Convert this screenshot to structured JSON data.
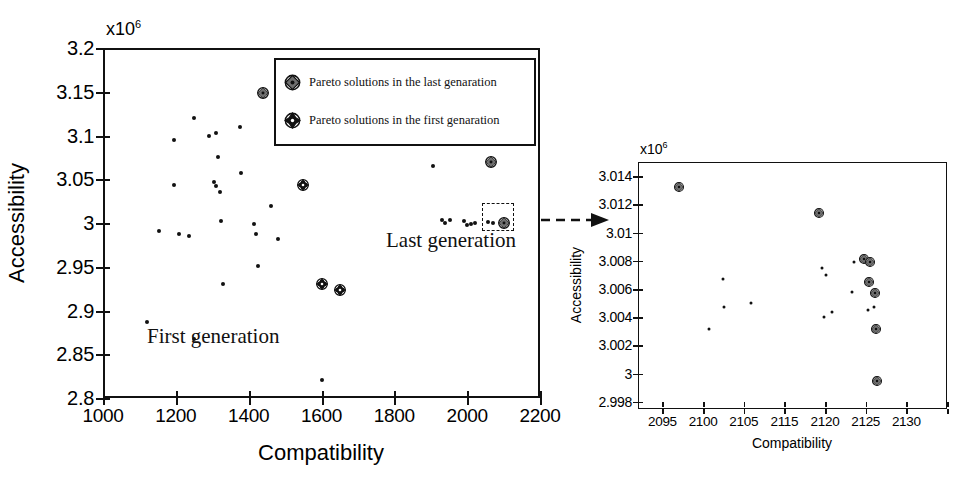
{
  "figure": {
    "background": "#ffffff",
    "ink_color": "#111111"
  },
  "main": {
    "exponent_label": "x10",
    "exponent_sup": "6",
    "x_title": "Compatibility",
    "y_title": "Accessibility",
    "x_ticks": [
      "1000",
      "1200",
      "1400",
      "1600",
      "1800",
      "2000",
      "2200"
    ],
    "y_ticks": [
      "3.2",
      "3.15",
      "3.1",
      "3.05",
      "3",
      "2.95",
      "2.9",
      "2.85",
      "2.8"
    ],
    "annotation_first": "First generation",
    "annotation_last": "Last generation",
    "legend": {
      "items": [
        {
          "marker": "pareto-last-marker",
          "label": "Pareto solutions in the last genaration"
        },
        {
          "marker": "pareto-first-marker",
          "label": "Pareto solutions in the first genaration"
        }
      ]
    }
  },
  "inset": {
    "exponent_label": "x10",
    "exponent_sup": "6",
    "x_title": "Compatibility",
    "y_title": "Accessibility",
    "x_ticks": [
      "2095",
      "2100",
      "2105",
      "2115",
      "2120",
      "2125",
      "2130"
    ],
    "y_ticks": [
      "3.014",
      "3.012",
      "3.01",
      "3.008",
      "3.006",
      "3.004",
      "3.002",
      "3",
      "2.998"
    ]
  },
  "chart_data": [
    {
      "id": "main-scatter",
      "type": "scatter",
      "title": "",
      "xlabel": "Compatibility",
      "ylabel": "Accessibility",
      "xlim": [
        1000,
        2200
      ],
      "ylim": [
        2800000,
        3200000
      ],
      "y_scale_multiplier": 1000000,
      "xticks": [
        1000,
        1200,
        1400,
        1600,
        1800,
        2000,
        2200
      ],
      "yticks": [
        2800000,
        2850000,
        2900000,
        2950000,
        3000000,
        3050000,
        3100000,
        3150000,
        3200000
      ],
      "grid": false,
      "legend_position": "top-right",
      "annotations": [
        {
          "text": "First generation",
          "x": 1180,
          "y": 2920000
        },
        {
          "text": "Last generation",
          "x": 1940,
          "y": 2975000
        }
      ],
      "series": [
        {
          "name": "First generation solutions",
          "marker": "small-dot",
          "points": [
            [
              1120,
              2887000
            ],
            [
              1155,
              2991000
            ],
            [
              1195,
              3095000
            ],
            [
              1195,
              3043000
            ],
            [
              1210,
              2988000
            ],
            [
              1235,
              2985000
            ],
            [
              1250,
              3120000
            ],
            [
              1250,
              2868000
            ],
            [
              1290,
              3100000
            ],
            [
              1305,
              3047000
            ],
            [
              1310,
              3103000
            ],
            [
              1310,
              3042000
            ],
            [
              1315,
              3075000
            ],
            [
              1320,
              3035000
            ],
            [
              1325,
              3002000
            ],
            [
              1330,
              2930000
            ],
            [
              1375,
              3110000
            ],
            [
              1380,
              3057000
            ],
            [
              1415,
              2999000
            ],
            [
              1420,
              2988000
            ],
            [
              1425,
              2951000
            ],
            [
              1460,
              3020000
            ],
            [
              1480,
              2982000
            ],
            [
              1600,
              2821000
            ],
            [
              1905,
              3065000
            ],
            [
              1930,
              3004000
            ],
            [
              1940,
              3000000
            ],
            [
              1952,
              3003000
            ],
            [
              1990,
              3002000
            ],
            [
              2000,
              2998000
            ],
            [
              2010,
              2999000
            ],
            [
              2022,
              3000000
            ],
            [
              2058,
              3001000
            ],
            [
              2072,
              3000000
            ]
          ]
        },
        {
          "name": "Pareto solutions in the last genaration",
          "marker": "pareto-last-marker",
          "points": [
            [
              1440,
              3149000
            ],
            [
              2065,
              3070000
            ],
            [
              2100,
              3000500
            ]
          ]
        },
        {
          "name": "Pareto solutions in the first genaration",
          "marker": "pareto-first-marker",
          "points": [
            [
              1550,
              3043000
            ],
            [
              1600,
              2930000
            ],
            [
              1650,
              2923000
            ]
          ]
        }
      ],
      "selection_box": {
        "x_range": [
          2080,
          2120
        ],
        "y_range": [
          2996000,
          3008000
        ]
      },
      "callout_arrow": {
        "from": "selection-box",
        "to": "inset-scatter",
        "style": "dashed"
      }
    },
    {
      "id": "inset-scatter",
      "type": "scatter",
      "title": "",
      "xlabel": "Compatibility",
      "ylabel": "Accessibility",
      "xlim": [
        2092,
        2130
      ],
      "ylim": [
        2997500,
        3015000
      ],
      "y_scale_multiplier": 1000000,
      "xticks": [
        2095,
        2100,
        2105,
        2110,
        2115,
        2120,
        2125,
        2130
      ],
      "xtick_labels": [
        "2095",
        "2100",
        "2105",
        "2115",
        "2120",
        "2125",
        "2130"
      ],
      "yticks": [
        2998000,
        3000000,
        3002000,
        3004000,
        3006000,
        3008000,
        3010000,
        3012000,
        3014000
      ],
      "grid": false,
      "legend_position": "none",
      "series": [
        {
          "name": "Non-Pareto solutions",
          "marker": "small-dot",
          "points": [
            [
              2100.7,
              3003200
            ],
            [
              2102.5,
              3006700
            ],
            [
              2102.6,
              3004700
            ],
            [
              2105.9,
              3005000
            ],
            [
              2114.6,
              3007500
            ],
            [
              2115.1,
              3007000
            ],
            [
              2114.9,
              3004000
            ],
            [
              2115.9,
              3004400
            ],
            [
              2118.3,
              3005800
            ],
            [
              2118.6,
              3007900
            ],
            [
              2120.3,
              3004500
            ],
            [
              2121.0,
              3004700
            ]
          ]
        },
        {
          "name": "Pareto solutions in the last genaration",
          "marker": "pareto-last-marker",
          "points": [
            [
              2097.0,
              3013200
            ],
            [
              2114.2,
              3011400
            ],
            [
              2119.8,
              3008100
            ],
            [
              2120.5,
              3007950
            ],
            [
              2120.4,
              3006500
            ],
            [
              2121.2,
              3005700
            ],
            [
              2121.3,
              3003200
            ],
            [
              2121.4,
              2999500
            ]
          ]
        }
      ]
    }
  ]
}
